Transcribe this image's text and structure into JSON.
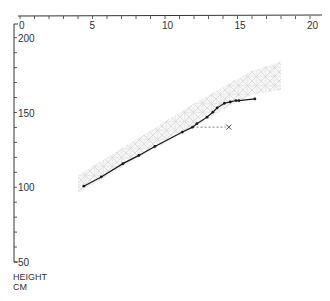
{
  "chart_data": {
    "type": "line",
    "title": "",
    "xlabel": "Age (years)",
    "ylabel": "HEIGHT CM",
    "ylabel_lines": [
      "HEIGHT",
      "CM"
    ],
    "x_axis_position": "top",
    "xlim": [
      0,
      20
    ],
    "ylim": [
      50,
      200
    ],
    "x_ticks": [
      0,
      5,
      10,
      15,
      20
    ],
    "x_tick_labels": [
      "0",
      "5",
      "10",
      "15",
      "20"
    ],
    "x_minor_step": 1,
    "y_ticks": [
      50,
      100,
      150,
      200
    ],
    "y_tick_labels": [
      "50",
      "100",
      "150",
      "200"
    ],
    "y_minor_step": 10,
    "grid": false,
    "series": [
      {
        "name": "measured height",
        "style": "solid line with dot markers",
        "x": [
          4.4,
          5.6,
          7.1,
          8.2,
          9.3,
          11.2,
          11.9,
          12.2,
          12.9,
          13.3,
          13.6,
          14.1,
          14.5,
          14.9,
          15.1,
          16.2
        ],
        "values": [
          100.7,
          106.9,
          115.8,
          121.3,
          127.3,
          136.9,
          140.2,
          142.5,
          146.9,
          150.2,
          153.1,
          156.2,
          157.1,
          158.0,
          158.0,
          159.1
        ]
      }
    ],
    "reference_band": {
      "name": "normal range (shaded cross-hatch)",
      "upper": [
        [
          4.0,
          108
        ],
        [
          8.0,
          132
        ],
        [
          12.0,
          156
        ],
        [
          16.0,
          178
        ],
        [
          18.0,
          184
        ]
      ],
      "lower": [
        [
          4.0,
          96
        ],
        [
          8.0,
          119
        ],
        [
          12.0,
          140
        ],
        [
          14.0,
          152
        ],
        [
          16.0,
          162
        ],
        [
          18.0,
          165
        ]
      ]
    },
    "annotations": [
      {
        "type": "dashed-line-to-marker",
        "from": [
          11.9,
          140.2
        ],
        "to": [
          14.4,
          140.2
        ],
        "marker": "x",
        "label": ""
      }
    ]
  },
  "axis": {
    "ylabel_line1": "HEIGHT",
    "ylabel_line2": "CM"
  },
  "colors": {
    "line": "#1a1a1a",
    "axis": "#333333",
    "band": "#bdbdbd"
  }
}
